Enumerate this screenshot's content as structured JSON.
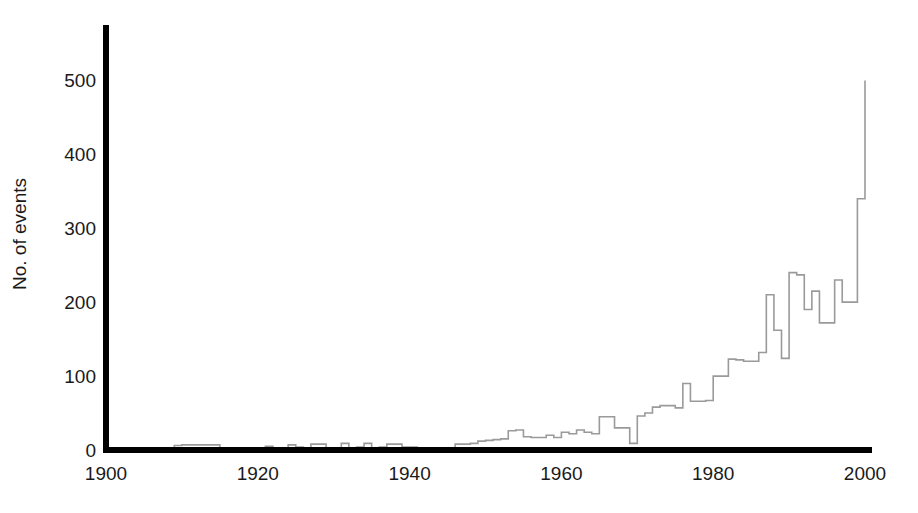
{
  "chart_data": {
    "type": "line",
    "title": "",
    "subtitle": "",
    "xlabel": "",
    "ylabel": "No. of events",
    "xlim": [
      1900,
      2000
    ],
    "ylim": [
      0,
      575
    ],
    "grid": false,
    "legend": null,
    "line_style": "step",
    "line_color": "#9a9a9a",
    "axis_color": "#000000",
    "x_ticks": [
      1900,
      1920,
      1940,
      1960,
      1980,
      2000
    ],
    "x_tick_labels": [
      "1900",
      "1920",
      "1940",
      "1960",
      "1980",
      "2000"
    ],
    "y_ticks": [
      0,
      100,
      200,
      300,
      400,
      500
    ],
    "y_tick_labels": [
      "0",
      "100",
      "200",
      "300",
      "400",
      "500"
    ],
    "x": [
      1900,
      1901,
      1902,
      1903,
      1904,
      1905,
      1906,
      1907,
      1908,
      1909,
      1910,
      1911,
      1912,
      1913,
      1914,
      1915,
      1916,
      1917,
      1918,
      1919,
      1920,
      1921,
      1922,
      1923,
      1924,
      1925,
      1926,
      1927,
      1928,
      1929,
      1930,
      1931,
      1932,
      1933,
      1934,
      1935,
      1936,
      1937,
      1938,
      1939,
      1940,
      1941,
      1942,
      1943,
      1944,
      1945,
      1946,
      1947,
      1948,
      1949,
      1950,
      1951,
      1952,
      1953,
      1954,
      1955,
      1956,
      1957,
      1958,
      1959,
      1960,
      1961,
      1962,
      1963,
      1964,
      1965,
      1966,
      1967,
      1968,
      1969,
      1970,
      1971,
      1972,
      1973,
      1974,
      1975,
      1976,
      1977,
      1978,
      1979,
      1980,
      1981,
      1982,
      1983,
      1984,
      1985,
      1986,
      1987,
      1988,
      1989,
      1990,
      1991,
      1992,
      1993,
      1994,
      1995,
      1996,
      1997,
      1998,
      1999,
      2000
    ],
    "values": [
      0,
      0,
      0,
      0,
      0,
      0,
      0,
      1,
      2,
      6,
      7,
      7,
      7,
      7,
      7,
      2,
      1,
      1,
      1,
      1,
      2,
      5,
      2,
      2,
      7,
      4,
      2,
      8,
      8,
      3,
      3,
      9,
      3,
      4,
      9,
      3,
      4,
      8,
      8,
      4,
      4,
      2,
      2,
      2,
      2,
      3,
      8,
      8,
      9,
      12,
      13,
      14,
      15,
      26,
      27,
      18,
      17,
      17,
      20,
      17,
      24,
      22,
      27,
      24,
      22,
      45,
      45,
      30,
      30,
      9,
      46,
      50,
      58,
      60,
      60,
      57,
      90,
      66,
      66,
      67,
      100,
      100,
      123,
      122,
      120,
      120,
      132,
      210,
      162,
      124,
      240,
      237,
      190,
      215,
      172,
      172,
      230,
      200,
      200,
      340,
      500
    ]
  }
}
